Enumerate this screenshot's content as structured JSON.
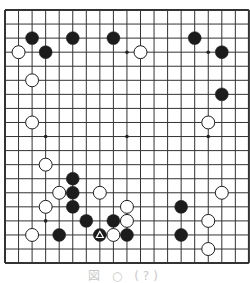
{
  "board": {
    "size": 19,
    "origin": {
      "x": 5,
      "y": 10
    },
    "cell": {
      "w": 13.55,
      "h": 14.06
    },
    "line_color": "#333333",
    "background": "#ffffff",
    "star_points": [
      [
        3,
        3
      ],
      [
        9,
        3
      ],
      [
        15,
        3
      ],
      [
        3,
        9
      ],
      [
        9,
        9
      ],
      [
        15,
        9
      ],
      [
        3,
        15
      ],
      [
        9,
        15
      ],
      [
        15,
        15
      ]
    ],
    "stones": [
      {
        "color": "black",
        "col": 2,
        "row": 2
      },
      {
        "color": "black",
        "col": 5,
        "row": 2
      },
      {
        "color": "black",
        "col": 8,
        "row": 2
      },
      {
        "color": "black",
        "col": 14,
        "row": 2
      },
      {
        "color": "white",
        "col": 1,
        "row": 3
      },
      {
        "color": "black",
        "col": 3,
        "row": 3
      },
      {
        "color": "white",
        "col": 10,
        "row": 3
      },
      {
        "color": "black",
        "col": 16,
        "row": 3
      },
      {
        "color": "white",
        "col": 2,
        "row": 5
      },
      {
        "color": "black",
        "col": 16,
        "row": 6
      },
      {
        "color": "white",
        "col": 2,
        "row": 8
      },
      {
        "color": "white",
        "col": 15,
        "row": 8
      },
      {
        "color": "white",
        "col": 3,
        "row": 11
      },
      {
        "color": "black",
        "col": 5,
        "row": 12
      },
      {
        "color": "white",
        "col": 4,
        "row": 13
      },
      {
        "color": "black",
        "col": 5,
        "row": 13
      },
      {
        "color": "white",
        "col": 7,
        "row": 13
      },
      {
        "color": "white",
        "col": 16,
        "row": 13
      },
      {
        "color": "white",
        "col": 3,
        "row": 14
      },
      {
        "color": "black",
        "col": 5,
        "row": 14
      },
      {
        "color": "white",
        "col": 9,
        "row": 14
      },
      {
        "color": "black",
        "col": 13,
        "row": 14
      },
      {
        "color": "black",
        "col": 6,
        "row": 15
      },
      {
        "color": "black",
        "col": 8,
        "row": 15
      },
      {
        "color": "white",
        "col": 9,
        "row": 15
      },
      {
        "color": "white",
        "col": 15,
        "row": 15
      },
      {
        "color": "white",
        "col": 2,
        "row": 16
      },
      {
        "color": "black",
        "col": 4,
        "row": 16
      },
      {
        "color": "black",
        "col": 7,
        "row": 16,
        "marker": "triangle"
      },
      {
        "color": "white",
        "col": 8,
        "row": 16
      },
      {
        "color": "black",
        "col": 9,
        "row": 16
      },
      {
        "color": "black",
        "col": 13,
        "row": 16
      },
      {
        "color": "white",
        "col": 15,
        "row": 17
      }
    ]
  },
  "caption": "図 ○ (?)"
}
